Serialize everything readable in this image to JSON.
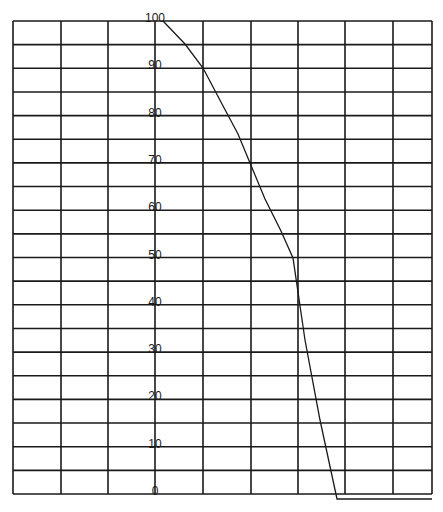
{
  "chart_data": {
    "type": "line",
    "title": "",
    "xlabel": "",
    "ylabel": "",
    "ylim": [
      0,
      100
    ],
    "y_ticks": [
      0,
      10,
      20,
      30,
      40,
      50,
      60,
      70,
      80,
      90,
      100
    ],
    "y_tick_labels": [
      "0",
      "10",
      "20",
      "30",
      "40",
      "50",
      "60",
      "70",
      "80",
      "90",
      "100"
    ],
    "grid": true,
    "grid_columns": 9,
    "grid_rows": 20,
    "x_ticks_labeled": false,
    "legend": null,
    "series": [
      {
        "name": "curve",
        "points_px": [
          [
            163,
            21
          ],
          [
            185,
            44
          ],
          [
            203,
            68
          ],
          [
            222,
            104
          ],
          [
            238,
            134
          ],
          [
            250,
            163
          ],
          [
            265,
            199
          ],
          [
            281,
            231
          ],
          [
            293,
            258
          ],
          [
            305,
            340
          ],
          [
            320,
            420
          ],
          [
            337,
            499
          ],
          [
            432,
            499
          ]
        ],
        "x_grid_units": [
          3.2,
          3.65,
          4.0,
          4.4,
          4.75,
          5.0,
          5.3,
          5.6,
          5.85,
          6.1,
          6.45,
          6.8,
          8.8
        ],
        "y_values": [
          100,
          95,
          90,
          82.5,
          76,
          70,
          62.5,
          55.5,
          50,
          32.5,
          16,
          -1,
          -1
        ]
      }
    ],
    "annotations": []
  }
}
